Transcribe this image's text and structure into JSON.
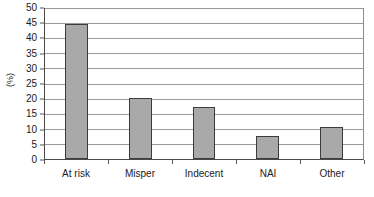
{
  "chart_data": {
    "type": "bar",
    "title": "",
    "subtitle": "",
    "xlabel": "",
    "ylabel": "(%)",
    "categories": [
      "At risk",
      "Misper",
      "Indecent",
      "NAI",
      "Other"
    ],
    "values": [
      44.5,
      20,
      17,
      7.5,
      10.5
    ],
    "ylim": [
      0,
      50
    ],
    "ytick_step": 5,
    "yticks": [
      0,
      5,
      10,
      15,
      20,
      25,
      30,
      35,
      40,
      45,
      50
    ],
    "ytick_labels": [
      "0",
      "5",
      "10",
      "15",
      "20",
      "25",
      "30",
      "35",
      "40",
      "45",
      "50"
    ],
    "grid": "horizontal",
    "legend": "none",
    "bar_fill_color": "#a9a9a9",
    "bar_border_color": "#3d3d3d",
    "gridline_color": "#9a9a9a",
    "axis_color": "#4a4a4a",
    "annotations": []
  }
}
